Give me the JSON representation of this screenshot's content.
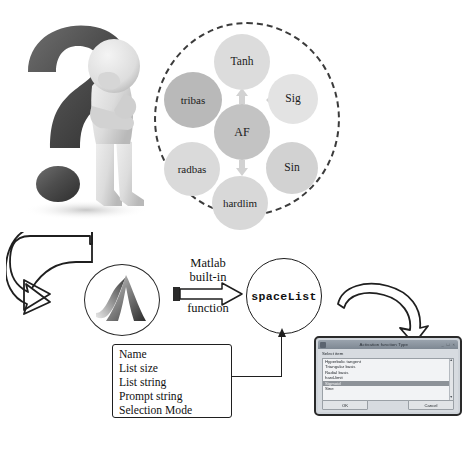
{
  "question_person": {
    "icon": "question-mark-person-illustration"
  },
  "af_diagram": {
    "center": {
      "label": "AF"
    },
    "nodes": [
      {
        "label": "Tanh",
        "color": "#dcdcdc"
      },
      {
        "label": "Sig",
        "color": "#e3e3e3"
      },
      {
        "label": "Sin",
        "color": "#d2d2d2"
      },
      {
        "label": "hardlim",
        "color": "#d8d8d8"
      },
      {
        "label": "radbas",
        "color": "#dadada"
      },
      {
        "label": "tribas",
        "color": "#b9b9b9"
      }
    ],
    "ring_style": "dashed"
  },
  "flow": {
    "matlab_logo": {
      "icon": "matlab-membrane-logo"
    },
    "arrow_label": {
      "line1": "Matlab",
      "line2": "built-in",
      "line3": "function"
    },
    "output_node": {
      "label": "spaceList"
    },
    "params": {
      "items": [
        "Name",
        "List size",
        "List string",
        "Prompt string",
        "Selection Mode"
      ]
    }
  },
  "dialog": {
    "title": "Activation function Type",
    "window_buttons": "_ □ ×",
    "prompt": "Select item",
    "list": {
      "items": [
        {
          "label": "Hyperbolic tangent",
          "selected": false
        },
        {
          "label": "Triangular basis",
          "selected": false
        },
        {
          "label": "Radial basis",
          "selected": false
        },
        {
          "label": "hard-limit",
          "selected": false
        },
        {
          "label": "Sigmoid",
          "selected": true
        },
        {
          "label": "Sine",
          "selected": false
        }
      ]
    },
    "scroll": {
      "up": "▲",
      "down": "▼"
    },
    "buttons": {
      "ok": "OK",
      "cancel": "Cancel"
    }
  },
  "colors": {
    "ink": "#1f1f1f",
    "ring": "#3b3b3b",
    "chevron": "#cccccc",
    "dialog_chrome": "#9aa3ad",
    "dialog_body": "#d7dbe0",
    "selection": "#8d9298"
  }
}
